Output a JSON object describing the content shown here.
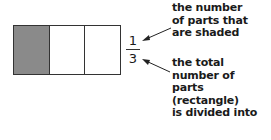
{
  "diagram": {
    "rectangle": {
      "parts": [
        {
          "shaded": true
        },
        {
          "shaded": false
        },
        {
          "shaded": false
        }
      ],
      "shade_color": "#8a8a8a"
    },
    "fraction": {
      "numerator": "1",
      "denominator": "3"
    },
    "labels": {
      "numerator_label": [
        "the number",
        "of parts that",
        "are shaded"
      ],
      "denominator_label": [
        "the total",
        "number of",
        "parts",
        "(rectangle)",
        "is divided into"
      ]
    }
  }
}
